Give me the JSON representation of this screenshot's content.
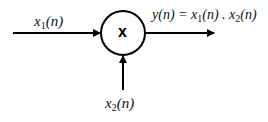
{
  "diagram": {
    "type": "signal-multiplier-block",
    "operator_symbol": "x",
    "input1": {
      "name": "x",
      "subscript": "1",
      "arg": "(n)"
    },
    "input2": {
      "name": "x",
      "subscript": "2",
      "arg": "(n)"
    },
    "output": {
      "lhs": "y(n) = ",
      "term1_name": "x",
      "term1_sub": "1",
      "term1_arg": "(n)",
      "dot": " . ",
      "term2_name": "x",
      "term2_sub": "2",
      "term2_arg": "(n)"
    }
  }
}
